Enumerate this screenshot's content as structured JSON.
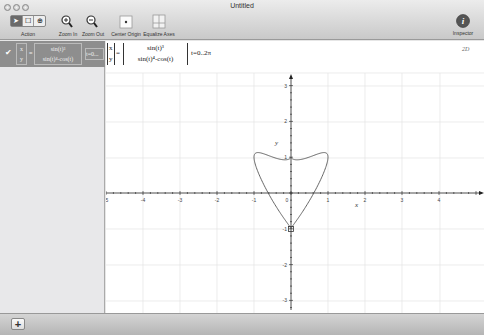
{
  "window": {
    "title": "Untitled"
  },
  "toolbar": {
    "actions_label": "Action",
    "zoom_in_label": "Zoom In",
    "zoom_out_label": "Zoom Out",
    "center_origin_label": "Center Origin",
    "equalize_axes_label": "Equalize Axes",
    "inspector_label": "Inspector",
    "action_segments": [
      "arrow",
      "hand",
      "zoom-rect"
    ]
  },
  "sidebar": {
    "items": [
      {
        "checked": true,
        "x_label": "x",
        "y_label": "y",
        "x_expr": "sin(t)³",
        "y_expr": "sin(t)⁴-cos(t)",
        "range_short": "t=0..."
      }
    ]
  },
  "equation": {
    "x_label": "x",
    "y_label": "y",
    "x_expr": "sin(t)³",
    "y_expr": "sin(t)⁴-cos(t)",
    "range": "t=0..2π",
    "dimension_badge": "2D"
  },
  "plot": {
    "x_axis_label": "x",
    "y_axis_label": "y",
    "x_ticks": [
      "-5",
      "-4",
      "-3",
      "-2",
      "-1",
      "0",
      "1",
      "2",
      "3",
      "4"
    ],
    "y_ticks": [
      "3",
      "2",
      "1",
      "-1",
      "-2",
      "-3"
    ]
  },
  "chart_data": {
    "type": "line",
    "title": "",
    "xlabel": "x",
    "ylabel": "y",
    "parametric": {
      "x": "sin(t)^3",
      "y": "sin(t)^4 - cos(t)",
      "t_range": [
        0,
        6.283
      ]
    },
    "xlim": [
      -5,
      5.2
    ],
    "ylim": [
      -3.2,
      3.3
    ],
    "grid": true,
    "series": [
      {
        "name": "parametric curve",
        "points": [
          [
            0,
            -1
          ],
          [
            0.11,
            -0.88
          ],
          [
            0.33,
            -0.64
          ],
          [
            0.6,
            -0.3
          ],
          [
            0.83,
            0.1
          ],
          [
            0.97,
            0.55
          ],
          [
            1,
            1
          ],
          [
            0.94,
            1.18
          ],
          [
            0.7,
            1.16
          ],
          [
            0.35,
            1.03
          ],
          [
            0.1,
            1.0
          ],
          [
            0,
            1
          ],
          [
            -0.1,
            1.0
          ],
          [
            -0.35,
            1.03
          ],
          [
            -0.7,
            1.16
          ],
          [
            -0.94,
            1.18
          ],
          [
            -1,
            1
          ],
          [
            -0.97,
            0.55
          ],
          [
            -0.83,
            0.1
          ],
          [
            -0.6,
            -0.3
          ],
          [
            -0.33,
            -0.64
          ],
          [
            -0.11,
            -0.88
          ],
          [
            0,
            -1
          ]
        ]
      }
    ]
  },
  "bottom": {
    "add_label": "+"
  }
}
